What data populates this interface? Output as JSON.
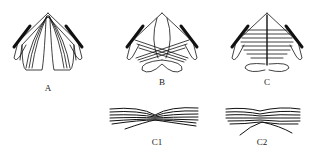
{
  "figure": {
    "panels": [
      {
        "id": "A",
        "label": "A",
        "description": "fiber bundles converging to apex, separated left/right"
      },
      {
        "id": "B",
        "label": "B",
        "description": "fibers crossing center with two lower loops"
      },
      {
        "id": "C",
        "label": "C",
        "description": "horizontal parallel fibers across midline with central vertical line"
      }
    ],
    "details": [
      {
        "id": "C1",
        "label": "C1",
        "description": "fiber bundle pinched at center"
      },
      {
        "id": "C2",
        "label": "C2",
        "description": "fiber bundle with crossing strands at center"
      }
    ]
  },
  "colors": {
    "stroke": "#111111",
    "background": "#ffffff"
  }
}
